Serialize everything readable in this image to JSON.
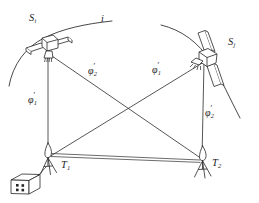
{
  "figure": {
    "kind": "satellite-geodesy-diagram",
    "background_color": "#ffffff",
    "ink_color": "#1d1d1d",
    "width": 259,
    "height": 203
  },
  "labels": {
    "satellite_left": {
      "base": "S",
      "sub": "i",
      "prime": "",
      "x": 30,
      "y": 18
    },
    "satellite_right": {
      "base": "S",
      "sub": "j",
      "prime": "",
      "x": 229,
      "y": 41
    },
    "orbit_track": {
      "base": "i",
      "sub": "",
      "prime": "",
      "x": 101,
      "y": 16
    },
    "station_left": {
      "base": "T",
      "sub": "1",
      "prime": "",
      "x": 61,
      "y": 163
    },
    "station_right": {
      "base": "T",
      "sub": "2",
      "prime": "",
      "x": 211,
      "y": 161
    },
    "angle_left_vertical": {
      "base": "φ",
      "sub": "1",
      "prime": "′",
      "x": 28,
      "y": 96
    },
    "angle_right_vertical": {
      "base": "φ",
      "sub": "2",
      "prime": "′",
      "x": 205,
      "y": 110
    },
    "angle_diagonal_left": {
      "base": "φ",
      "sub": "2",
      "prime": "′",
      "x": 88,
      "y": 68
    },
    "angle_diagonal_right": {
      "base": "φ",
      "sub": "1",
      "prime": "′",
      "x": 152,
      "y": 67
    }
  },
  "nodes": {
    "satellite_left": {
      "x": 48,
      "y": 53
    },
    "satellite_right": {
      "x": 209,
      "y": 60
    },
    "station_left": {
      "x": 48,
      "y": 158
    },
    "station_right": {
      "x": 203,
      "y": 161
    },
    "crossing": {
      "x": 126,
      "y": 113
    }
  },
  "sight_lines": [
    {
      "name": "left-vertical",
      "from": "satellite_left",
      "to": "station_left"
    },
    {
      "name": "right-vertical",
      "from": "satellite_right",
      "to": "station_right"
    },
    {
      "name": "diagonal-left-sat-to-right-station",
      "from": "satellite_left",
      "to": "station_right"
    },
    {
      "name": "diagonal-right-sat-to-left-station",
      "from": "satellite_right",
      "to": "station_left"
    }
  ],
  "baseline": {
    "name": "ground-baseline",
    "from": "station_left",
    "to": "station_right",
    "style": "double-line"
  },
  "orbit_arcs": [
    {
      "name": "orbit-arc-left",
      "path": "M 10,84 C 16,58 34,40 58,33 C 78,27 94,24 110,21"
    },
    {
      "name": "orbit-arc-right",
      "path": "M 162,26 C 186,32 205,48 216,70 C 226,90 232,104 238,116"
    }
  ],
  "ground_box": {
    "name": "ground-control-building",
    "x": 10,
    "y": 172,
    "windows": 4
  }
}
